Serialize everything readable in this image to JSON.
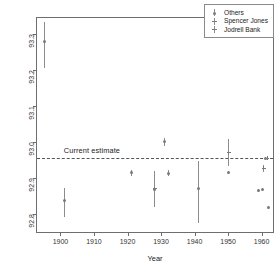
{
  "chart_data": {
    "type": "scatter",
    "title": "",
    "xlabel": "Year",
    "ylabel": "Astronomical unit (millions of miles)",
    "xlim": [
      1893,
      1964
    ],
    "ylim": [
      92.745,
      93.345
    ],
    "xticks": [
      1900,
      1910,
      1920,
      1930,
      1940,
      1950,
      1960
    ],
    "yticks": [
      92.8,
      92.9,
      93.0,
      93.1,
      93.2,
      93.3
    ],
    "grid": false,
    "legend_position": "top-right",
    "annotations": [
      {
        "text": "Current estimate",
        "y": 92.956,
        "x": 1901
      }
    ],
    "reference_line": {
      "label": "Current estimate",
      "value": 92.956,
      "style": "dashed"
    },
    "series": [
      {
        "name": "Others",
        "marker": "open-circle",
        "points": [
          {
            "x": 1895,
            "y": 93.28,
            "low": 93.205,
            "high": 93.335
          },
          {
            "x": 1901,
            "y": 92.838,
            "low": 92.792,
            "high": 92.873
          },
          {
            "x": 1921,
            "y": 92.915,
            "low": 92.907,
            "high": 92.923
          },
          {
            "x": 1928,
            "y": 92.869,
            "low": 92.822,
            "high": 92.916
          },
          {
            "x": 1931,
            "y": 93.001,
            "low": 92.99,
            "high": 93.013
          },
          {
            "x": 1932,
            "y": 92.914,
            "low": 92.906,
            "high": 92.922
          },
          {
            "x": 1941,
            "y": 92.872,
            "low": 92.775,
            "high": 92.948
          },
          {
            "x": 1950,
            "y": 92.916,
            "low": 92.912,
            "high": 92.92
          },
          {
            "x": 1959,
            "y": 92.866,
            "low": 92.862,
            "high": 92.87
          },
          {
            "x": 1960,
            "y": 92.868,
            "low": 92.864,
            "high": 92.872
          },
          {
            "x": 1961,
            "y": 92.956,
            "low": 92.954,
            "high": 92.958
          },
          {
            "x": 1962,
            "y": 92.819,
            "low": 92.816,
            "high": 92.822
          }
        ]
      },
      {
        "name": "Spencer Jones",
        "marker": "cross",
        "points": [
          {
            "x": 1928,
            "y": 92.871,
            "low": 92.82,
            "high": 92.92
          },
          {
            "x": 1950,
            "y": 92.971,
            "low": 92.934,
            "high": 93.008
          }
        ]
      },
      {
        "name": "Jodrell Bank",
        "marker": "cross-bar",
        "points": [
          {
            "x": 1960.5,
            "y": 92.928,
            "low": 92.918,
            "high": 92.938
          },
          {
            "x": 1961.5,
            "y": 92.956,
            "low": 92.952,
            "high": 92.96
          }
        ]
      }
    ]
  },
  "axes": {
    "y_title": "Astronomical unit (millions of miles)",
    "x_title": "Year",
    "y_tick_labels": [
      "92.8",
      "92.9",
      "93.0",
      "93.1",
      "93.2",
      "93.3"
    ],
    "x_tick_labels": [
      "1900",
      "1910",
      "1920",
      "1930",
      "1940",
      "1950",
      "1960"
    ]
  },
  "legend": {
    "items": [
      {
        "label": "Others",
        "key": "open-circle-bar"
      },
      {
        "label": "Spencer Jones",
        "key": "cross-bar"
      },
      {
        "label": "Jodrell Bank",
        "key": "cross-bar"
      }
    ]
  },
  "annotation": {
    "current_estimate": "Current estimate"
  },
  "colors": {
    "frame": "#6e6e6e",
    "marker": "#7a7a7a",
    "errorbar": "#8c8c8c",
    "refline": "#555555",
    "text": "#222222",
    "background": "#ffffff"
  }
}
